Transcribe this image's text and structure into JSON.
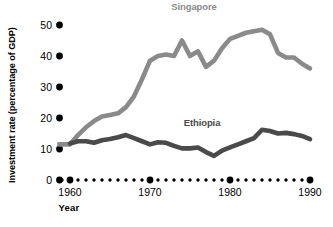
{
  "chart_data": {
    "type": "line",
    "title": "",
    "xlabel": "Year",
    "ylabel": "Investment rate (percentage of GDP)",
    "xlim": [
      1960,
      1990
    ],
    "ylim": [
      0,
      50
    ],
    "yticks": [
      0,
      10,
      20,
      30,
      40,
      50
    ],
    "ytick_labels": [
      "0",
      "10",
      "20",
      "30",
      "40",
      "50"
    ],
    "xticks": [
      1960,
      1970,
      1980,
      1990
    ],
    "xtick_labels": [
      "1960",
      "1970",
      "1980",
      "1990"
    ],
    "x": [
      1960,
      1961,
      1962,
      1963,
      1964,
      1965,
      1966,
      1967,
      1968,
      1969,
      1970,
      1971,
      1972,
      1973,
      1974,
      1975,
      1976,
      1977,
      1978,
      1979,
      1980,
      1981,
      1982,
      1983,
      1984,
      1985,
      1986,
      1987,
      1988,
      1989,
      1990
    ],
    "grid": false,
    "legend_position": "inline-labels",
    "series": [
      {
        "name": "Singapore",
        "color": "#8a8a8a",
        "label_x": 1975.5,
        "label_y": 55,
        "values": [
          11.5,
          14.5,
          17.0,
          19.0,
          20.5,
          21.0,
          21.5,
          23.5,
          27.0,
          32.5,
          38.5,
          40.0,
          40.5,
          40.0,
          45.0,
          40.0,
          41.5,
          36.5,
          38.5,
          42.5,
          45.5,
          46.5,
          47.5,
          48.0,
          48.5,
          47.0,
          41.0,
          39.5,
          39.5,
          37.5,
          36.0
        ]
      },
      {
        "name": "Ethiopia",
        "color": "#4a4a4a",
        "label_x": 1976.5,
        "label_y": 17.5,
        "values": [
          11.8,
          12.5,
          12.5,
          12.0,
          12.8,
          13.2,
          13.8,
          14.5,
          13.5,
          12.5,
          11.5,
          12.2,
          12.0,
          11.0,
          10.2,
          10.2,
          10.5,
          9.0,
          7.8,
          9.5,
          10.5,
          11.5,
          12.5,
          13.5,
          16.2,
          15.8,
          15.0,
          15.2,
          14.8,
          14.2,
          13.2
        ]
      }
    ],
    "pre_1960_stub": {
      "description": "short flat line segment extending left of 1960 at about 11.5",
      "value": 11.5,
      "x_start": 1958.4
    },
    "axis_dot_years": [
      1959,
      1960,
      1961,
      1962,
      1963,
      1964,
      1965,
      1966,
      1967,
      1968,
      1969,
      1970,
      1971,
      1972,
      1973,
      1974,
      1975,
      1976,
      1977,
      1978,
      1979,
      1980,
      1981,
      1982,
      1983,
      1984,
      1985,
      1986,
      1987,
      1988,
      1989,
      1990
    ],
    "axis_dot_major_years": [
      1960,
      1970,
      1980,
      1990
    ],
    "colors": {
      "singapore_line": "#8a8a8a",
      "ethiopia_line": "#4a4a4a",
      "axis_marker": "#000000",
      "text": "#000000",
      "background": "#ffffff"
    }
  }
}
